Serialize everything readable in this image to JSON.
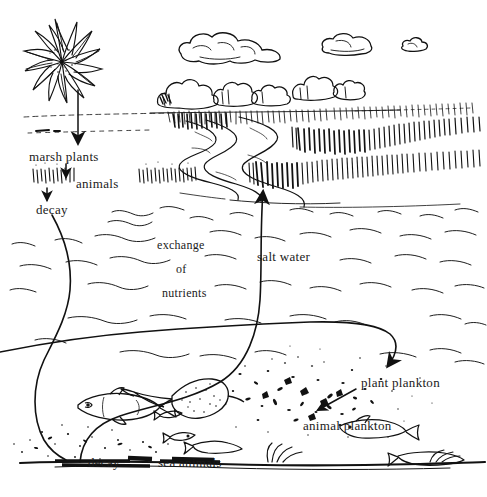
{
  "diagram": {
    "background_color": "#ffffff",
    "ink_color": "#111111",
    "width": 487,
    "height": 497
  },
  "labels": {
    "marsh_plants": "marsh plants",
    "animals": "animals",
    "decay_top": "decay",
    "exchange": "exchange",
    "of": "of",
    "nutrients": "nutrients",
    "salt_water": "salt water",
    "plant_plankton": "plant plankton",
    "animal_plankton": "animal plankton",
    "decay_bottom": "decay",
    "sea_animals": "sea animals"
  },
  "elements": {
    "sun": "sun-icon",
    "clouds": [
      "cloud-large",
      "cloud-medium",
      "cloud-small"
    ],
    "trees": "tree-line",
    "marsh_grass": "marsh-grass",
    "creek": "tidal-creek",
    "water_surface": "salt-water-waves",
    "seafloor": "sea-floor",
    "fish": [
      "large-fish",
      "skate-ray",
      "small-fish-1",
      "small-fish-2",
      "small-fish-3",
      "small-fish-4"
    ],
    "plankton": "plankton-specks",
    "detritus": "detritus-specks"
  },
  "arrows": {
    "sun_to_marsh": "arrow-down-sun-to-marsh-plants",
    "marsh_to_animals": "arrow-down-marsh-to-animals",
    "animals_to_decay": "arrow-down-animals-to-decay",
    "decay_to_sea": "curve-decay-down-to-seafloor",
    "sea_to_surface": "curve-seafloor-up-to-marsh-creek",
    "surface_to_plankton": "curve-down-to-plant-plankton",
    "plankton_link": "arrow-plant-to-animal-plankton"
  }
}
